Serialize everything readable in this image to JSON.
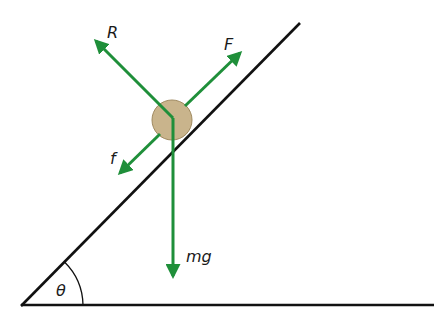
{
  "diagram": {
    "colors": {
      "force_arrow": "#1f8f3a",
      "incline": "#111111",
      "ball_fill": "#c9b48c",
      "ball_stroke": "#a08a60"
    },
    "labels": {
      "normal_reaction": "R",
      "applied_force": "F",
      "friction": "f",
      "weight": "mg",
      "angle": "θ"
    },
    "forces": [
      {
        "name": "R",
        "description": "normal reaction, perpendicular to incline"
      },
      {
        "name": "F",
        "description": "applied force, up the incline"
      },
      {
        "name": "f",
        "description": "friction, down the incline"
      },
      {
        "name": "mg",
        "description": "weight, vertically downward"
      }
    ]
  }
}
